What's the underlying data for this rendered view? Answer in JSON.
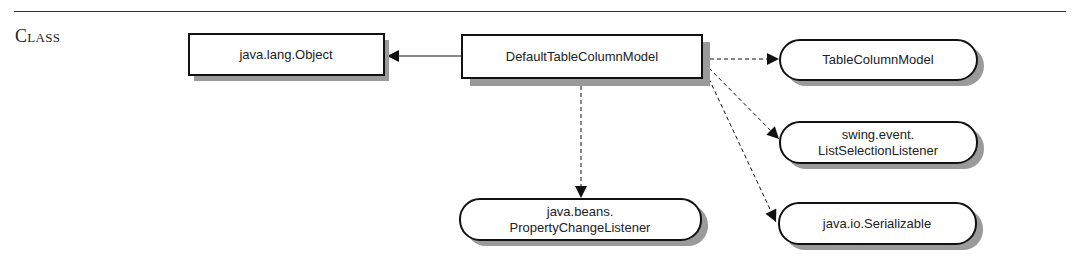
{
  "section": {
    "label": "Class"
  },
  "diagram": {
    "colors": {
      "stroke": "#111111",
      "shadow": "#9a9a9a",
      "fill": "#ffffff"
    },
    "nodes": {
      "superclass": {
        "kind": "class",
        "lines": [
          "java.lang.Object"
        ]
      },
      "main": {
        "kind": "class",
        "lines": [
          "DefaultTableColumnModel"
        ]
      },
      "iface_tcm": {
        "kind": "interface",
        "lines": [
          "TableColumnModel"
        ]
      },
      "iface_lsl": {
        "kind": "interface",
        "lines": [
          "swing.event.",
          "ListSelectionListener"
        ]
      },
      "iface_ser": {
        "kind": "interface",
        "lines": [
          "java.io.Serializable"
        ]
      },
      "iface_pcl": {
        "kind": "interface",
        "lines": [
          "java.beans.",
          "PropertyChangeListener"
        ]
      }
    },
    "edges": [
      {
        "from": "main",
        "to": "superclass",
        "style": "solid",
        "meaning": "extends"
      },
      {
        "from": "main",
        "to": "iface_tcm",
        "style": "dashed",
        "meaning": "implements"
      },
      {
        "from": "main",
        "to": "iface_lsl",
        "style": "dashed",
        "meaning": "implements"
      },
      {
        "from": "main",
        "to": "iface_ser",
        "style": "dashed",
        "meaning": "implements"
      },
      {
        "from": "main",
        "to": "iface_pcl",
        "style": "dashed",
        "meaning": "implements"
      }
    ]
  }
}
